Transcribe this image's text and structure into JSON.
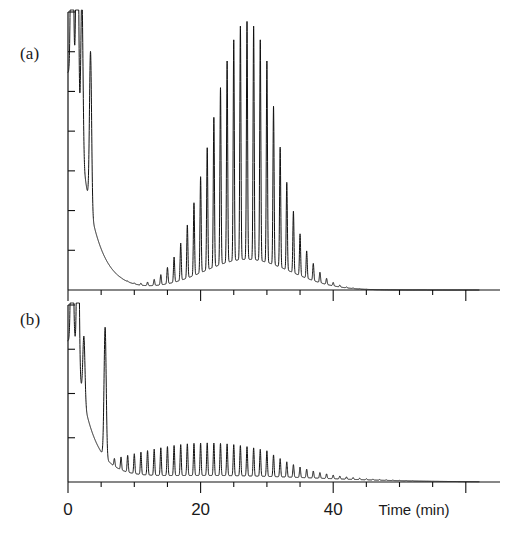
{
  "figure": {
    "type": "two-panel-chromatogram",
    "background": "#ffffff",
    "trace_color": "#111111"
  },
  "panels": [
    {
      "tag": "(a)"
    },
    {
      "tag": "(b)"
    }
  ],
  "axis": {
    "x_title": "Time  (min)",
    "x_unit": "min",
    "major_ticks": [
      0,
      20,
      40
    ],
    "major_tick_labels": [
      "0",
      "20",
      "40"
    ],
    "minor_tick_step": 5,
    "x_min": 0,
    "x_max": 62,
    "y_ticks_count": 7
  },
  "chart_data": {
    "type": "line",
    "title": "",
    "xlabel": "Time  (min)",
    "ylabel": "",
    "xlim": [
      0,
      62
    ],
    "ylim": [
      0,
      1
    ],
    "grid": false,
    "legend": "none",
    "series": [
      {
        "name": "(a)",
        "description": "Oligomer series with broad Gaussian-modulated envelope peaking near 27 min",
        "solvent_peaks_time": [
          0.6,
          1.4,
          2.1,
          3.4
        ],
        "solvent_peaks_height": [
          1.25,
          1.25,
          0.62,
          0.62
        ],
        "oligomer_start_time": 7.0,
        "oligomer_spacing_min": 1.0,
        "oligomer_count": 46,
        "envelope_center_time": 27.0,
        "envelope_sigma_min": 5.2,
        "envelope_peak_height": 0.93,
        "baseline_hump_height": 0.12,
        "tail_decay": "exponential to near-zero by 55 min"
      },
      {
        "name": "(b)",
        "description": "Same oligomer series without the large envelope; only small uniform peaks decaying with time",
        "solvent_peaks_time": [
          0.6,
          1.5,
          2.4,
          5.6
        ],
        "solvent_peaks_height": [
          1.25,
          1.25,
          0.4,
          0.8
        ],
        "oligomer_start_time": 7.0,
        "oligomer_spacing_min": 1.0,
        "oligomer_count": 46,
        "envelope_center_time": 21.0,
        "envelope_sigma_min": 13.0,
        "envelope_peak_height": 0.2,
        "baseline_hump_height": 0.04,
        "tail_decay": "exponential to near-zero by 50 min"
      }
    ]
  }
}
